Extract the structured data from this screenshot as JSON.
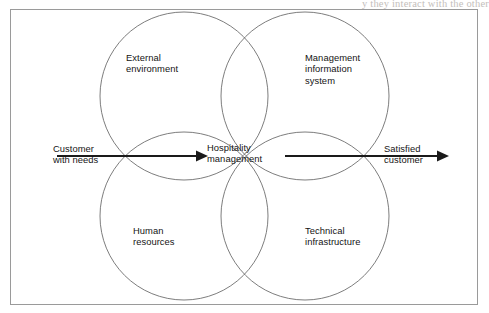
{
  "page": {
    "bleed_through_text": "y they interact with the other",
    "frame_color": "#9a9a9a",
    "circle_stroke_color": "#6e6e6e",
    "arrow_color": "#1a1a1a",
    "background_color": "#ffffff"
  },
  "diagram": {
    "type": "four-circle-venn",
    "center_label": "Hospitality\nmanagement",
    "circles": [
      {
        "id": "external-environment",
        "label": "External\nenvironment",
        "position": "top-left"
      },
      {
        "id": "management-information-system",
        "label": "Management\ninformation\nsystem",
        "position": "top-right"
      },
      {
        "id": "human-resources",
        "label": "Human\nresources",
        "position": "bottom-left"
      },
      {
        "id": "technical-infrastructure",
        "label": "Technical\ninfrastructure",
        "position": "bottom-right"
      }
    ],
    "flow": {
      "input_label": "Customer\nwith needs",
      "output_label": "Satisfied\ncustomer",
      "direction": "left-to-right"
    }
  }
}
